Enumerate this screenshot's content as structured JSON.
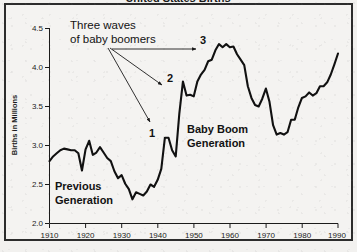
{
  "figure": {
    "background_color": "#f4f3f1",
    "border_color": "#2c2c2c",
    "line_color": "#111111",
    "text_color": "#121212",
    "clipped_title": "United States Births"
  },
  "axes": {
    "y_title": "Births in Millions",
    "y_ticks": [
      "2.0",
      "2.5",
      "3.0",
      "3.5",
      "4.0",
      "4.5"
    ],
    "x_ticks": [
      "1910",
      "1920",
      "1930",
      "1940",
      "1950",
      "1960",
      "1970",
      "1980",
      "1990"
    ]
  },
  "annotations": {
    "note_line1": "Three waves",
    "note_line2": "of baby boomers",
    "wave_1": "1",
    "wave_2": "2",
    "wave_3": "3",
    "previous_line1": "Previous",
    "previous_line2": "Generation",
    "boom_line1": "Baby Boom",
    "boom_line2": "Generation"
  },
  "chart_data": {
    "type": "line",
    "title": "United States Births",
    "xlabel": "",
    "ylabel": "Births in Millions",
    "xlim": [
      1910,
      1990
    ],
    "ylim": [
      2.0,
      4.5
    ],
    "grid": false,
    "legend": false,
    "x": [
      1910,
      1911,
      1912,
      1913,
      1914,
      1915,
      1916,
      1917,
      1918,
      1919,
      1920,
      1921,
      1922,
      1923,
      1924,
      1925,
      1926,
      1927,
      1928,
      1929,
      1930,
      1931,
      1932,
      1933,
      1934,
      1935,
      1936,
      1937,
      1938,
      1939,
      1940,
      1941,
      1942,
      1943,
      1944,
      1945,
      1946,
      1947,
      1948,
      1949,
      1950,
      1951,
      1952,
      1953,
      1954,
      1955,
      1956,
      1957,
      1958,
      1959,
      1960,
      1961,
      1962,
      1963,
      1964,
      1965,
      1966,
      1967,
      1968,
      1969,
      1970,
      1971,
      1972,
      1973,
      1974,
      1975,
      1976,
      1977,
      1978,
      1979,
      1980,
      1981,
      1982,
      1983,
      1984,
      1985,
      1986,
      1987,
      1988,
      1989,
      1990
    ],
    "y": [
      2.8,
      2.86,
      2.9,
      2.94,
      2.96,
      2.95,
      2.94,
      2.94,
      2.9,
      2.68,
      2.95,
      3.06,
      2.88,
      2.91,
      2.98,
      2.91,
      2.84,
      2.8,
      2.67,
      2.58,
      2.62,
      2.51,
      2.44,
      2.31,
      2.4,
      2.38,
      2.36,
      2.41,
      2.5,
      2.47,
      2.56,
      2.7,
      3.1,
      3.1,
      2.94,
      2.86,
      3.41,
      3.82,
      3.64,
      3.65,
      3.63,
      3.82,
      3.91,
      3.97,
      4.08,
      4.1,
      4.22,
      4.3,
      4.26,
      4.3,
      4.26,
      4.27,
      4.17,
      4.1,
      4.03,
      3.76,
      3.61,
      3.52,
      3.5,
      3.6,
      3.73,
      3.56,
      3.26,
      3.14,
      3.16,
      3.14,
      3.17,
      3.33,
      3.33,
      3.49,
      3.61,
      3.63,
      3.68,
      3.64,
      3.67,
      3.76,
      3.76,
      3.81,
      3.91,
      4.04,
      4.18
    ],
    "markers": [
      {
        "label": "1",
        "year": 1942,
        "value": 3.1
      },
      {
        "label": "2",
        "year": 1947,
        "value": 3.82
      },
      {
        "label": "3",
        "year": 1957,
        "value": 4.3
      }
    ]
  }
}
